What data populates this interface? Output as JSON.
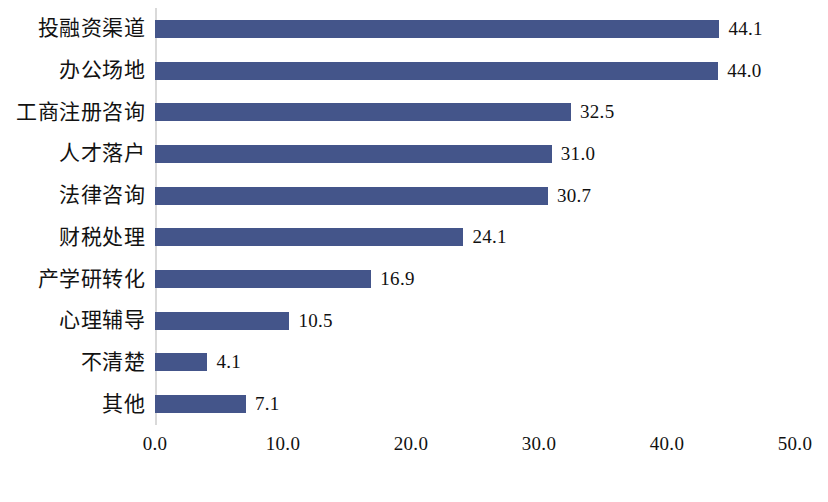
{
  "chart_data": {
    "type": "bar",
    "orientation": "horizontal",
    "title": "",
    "subtitle": "",
    "xlabel": "",
    "ylabel": "",
    "xlim": [
      0.0,
      50.0
    ],
    "xticks": [
      "0.0",
      "10.0",
      "20.0",
      "30.0",
      "40.0",
      "50.0"
    ],
    "xtick_values": [
      0,
      10,
      20,
      30,
      40,
      50
    ],
    "grid": false,
    "legend": false,
    "legend_position": "none",
    "bar_color": "#44558a",
    "axis_color": "#d9d9d9",
    "text_color": "#111111",
    "background": "#ffffff",
    "categories": [
      "投融资渠道",
      "办公场地",
      "工商注册咨询",
      "人才落户",
      "法律咨询",
      "财税处理",
      "产学研转化",
      "心理辅导",
      "不清楚",
      "其他"
    ],
    "values": [
      44.1,
      44.0,
      32.5,
      31.0,
      30.7,
      24.1,
      16.9,
      10.5,
      4.1,
      7.1
    ],
    "value_labels": [
      "44.1",
      "44.0",
      "32.5",
      "31.0",
      "30.7",
      "24.1",
      "16.9",
      "10.5",
      "4.1",
      "7.1"
    ]
  }
}
